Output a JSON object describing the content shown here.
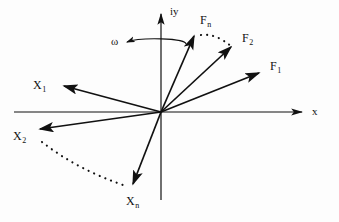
{
  "figure": {
    "kind": "vector-phasor-diagram",
    "background_color": "#fdfdfd",
    "stroke_color": "#111111",
    "width": 339,
    "height": 222
  },
  "axes": {
    "x_label": "x",
    "y_label": "iy",
    "origin": {
      "x": 161,
      "y": 112
    },
    "x_start": {
      "x": 14,
      "y": 112
    },
    "x_end": {
      "x": 307,
      "y": 112
    },
    "y_start": {
      "x": 161,
      "y": 200
    },
    "y_end": {
      "x": 161,
      "y": 9
    }
  },
  "rotation": {
    "label": "ω",
    "label_x": 111,
    "label_y": 37,
    "direction": "counterclockwise",
    "arrow_tip": {
      "x": 126,
      "y": 42
    }
  },
  "vectors": [
    {
      "name": "F1",
      "label": "F",
      "subscript": "1",
      "tip": {
        "x": 264,
        "y": 70
      },
      "label_x": 270,
      "label_y": 60,
      "style": "solid"
    },
    {
      "name": "F2",
      "label": "F",
      "subscript": "2",
      "tip": {
        "x": 236,
        "y": 43
      },
      "label_x": 242,
      "label_y": 32,
      "style": "solid"
    },
    {
      "name": "Fn",
      "label": "F",
      "subscript": "n",
      "tip": {
        "x": 197,
        "y": 31
      },
      "label_x": 200,
      "label_y": 14,
      "style": "solid"
    },
    {
      "name": "X1",
      "label": "X",
      "subscript": "1",
      "tip": {
        "x": 59,
        "y": 84
      },
      "label_x": 33,
      "label_y": 79,
      "style": "solid"
    },
    {
      "name": "X2",
      "label": "X",
      "subscript": "2",
      "tip": {
        "x": 34,
        "y": 130
      },
      "label_x": 13,
      "label_y": 130,
      "style": "solid"
    },
    {
      "name": "Xn",
      "label": "X",
      "subscript": "n",
      "tip": {
        "x": 129,
        "y": 189
      },
      "label_x": 126,
      "label_y": 195,
      "style": "solid"
    }
  ],
  "dotted_arcs": [
    {
      "name": "arc-Fn-to-F2",
      "from": {
        "x": 201,
        "y": 35
      },
      "to": {
        "x": 232,
        "y": 47
      },
      "control": {
        "x": 216,
        "y": 33
      }
    },
    {
      "name": "arc-X2-to-Xn",
      "from": {
        "x": 42,
        "y": 142
      },
      "to": {
        "x": 126,
        "y": 186
      },
      "control": {
        "x": 78,
        "y": 170
      }
    }
  ]
}
